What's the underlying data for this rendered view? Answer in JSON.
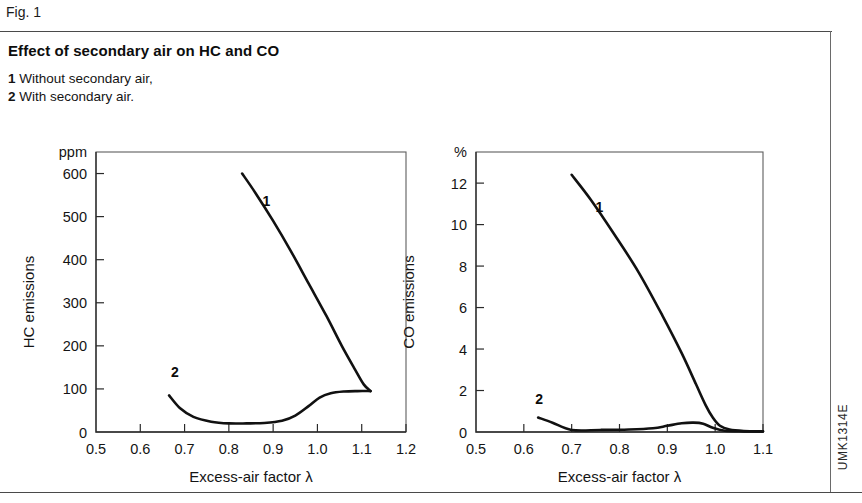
{
  "figure": {
    "number_label": "Fig. 1",
    "title": "Effect of secondary air on HC and CO",
    "legend": [
      {
        "key": "1",
        "text": "Without secondary air,"
      },
      {
        "key": "2",
        "text": "With secondary air."
      }
    ],
    "source_code": "UMK1314E",
    "line_color": "#111111",
    "frame_color": "#5e5e5e",
    "rule_color": "#4a4a4a"
  },
  "chart_data": [
    {
      "id": "hc-chart",
      "type": "line",
      "title": "",
      "xlabel": "Excess-air factor λ",
      "ylabel": "HC emissions",
      "yunit": "ppm",
      "xunit": "",
      "xlim": [
        0.5,
        1.2
      ],
      "ylim": [
        0,
        650
      ],
      "xticks": [
        0.5,
        0.6,
        0.7,
        0.8,
        0.9,
        1.0,
        1.1,
        1.2
      ],
      "xticklabels": [
        "0.5",
        "0.6",
        "0.7",
        "0.8",
        "0.9",
        "1.0",
        "1.1",
        "1.2"
      ],
      "yticks": [
        0,
        100,
        200,
        300,
        400,
        500,
        600
      ],
      "yticklabels": [
        "0",
        "100",
        "200",
        "300",
        "400",
        "500",
        "600"
      ],
      "grid": false,
      "legend_position": "inline-annotations",
      "series": [
        {
          "name": "1",
          "label": "Without secondary air",
          "annotation": "1",
          "annotation_at": [
            0.885,
            525
          ],
          "x": [
            0.83,
            0.86,
            0.9,
            0.94,
            0.98,
            1.02,
            1.055,
            1.085,
            1.105,
            1.12
          ],
          "y": [
            600,
            555,
            490,
            420,
            345,
            270,
            200,
            145,
            110,
            95
          ]
        },
        {
          "name": "2",
          "label": "With secondary air",
          "annotation": "2",
          "annotation_at": [
            0.678,
            128
          ],
          "x": [
            0.665,
            0.69,
            0.72,
            0.76,
            0.8,
            0.84,
            0.88,
            0.92,
            0.95,
            0.98,
            1.005,
            1.03,
            1.06,
            1.09,
            1.12
          ],
          "y": [
            85,
            55,
            35,
            24,
            20,
            20,
            21,
            26,
            38,
            60,
            80,
            90,
            94,
            95,
            95
          ]
        }
      ]
    },
    {
      "id": "co-chart",
      "type": "line",
      "title": "",
      "xlabel": "Excess-air factor λ",
      "ylabel": "CO emissions",
      "yunit": "%",
      "xunit": "",
      "xlim": [
        0.5,
        1.1
      ],
      "ylim": [
        0,
        13.5
      ],
      "xticks": [
        0.5,
        0.6,
        0.7,
        0.8,
        0.9,
        1.0,
        1.1
      ],
      "xticklabels": [
        "0.5",
        "0.6",
        "0.7",
        "0.8",
        "0.9",
        "1.0",
        "1.1"
      ],
      "yticks": [
        0,
        2,
        4,
        6,
        8,
        10,
        12
      ],
      "yticklabels": [
        "0",
        "2",
        "4",
        "6",
        "8",
        "10",
        "12"
      ],
      "grid": false,
      "legend_position": "inline-annotations",
      "series": [
        {
          "name": "1",
          "label": "Without secondary air",
          "annotation": "1",
          "annotation_at": [
            0.758,
            10.6
          ],
          "x": [
            0.7,
            0.74,
            0.79,
            0.84,
            0.89,
            0.93,
            0.96,
            0.98,
            0.995,
            1.01,
            1.03,
            1.06,
            1.1
          ],
          "y": [
            12.4,
            11.2,
            9.5,
            7.7,
            5.6,
            3.8,
            2.3,
            1.3,
            0.7,
            0.3,
            0.12,
            0.05,
            0.03
          ]
        },
        {
          "name": "2",
          "label": "With secondary air",
          "annotation": "2",
          "annotation_at": [
            0.632,
            1.35
          ],
          "x": [
            0.63,
            0.66,
            0.7,
            0.76,
            0.82,
            0.87,
            0.9,
            0.93,
            0.955,
            0.975,
            0.995,
            1.02,
            1.06,
            1.1
          ],
          "y": [
            0.7,
            0.45,
            0.1,
            0.1,
            0.12,
            0.18,
            0.3,
            0.42,
            0.45,
            0.4,
            0.2,
            0.06,
            0.03,
            0.03
          ]
        }
      ]
    }
  ]
}
